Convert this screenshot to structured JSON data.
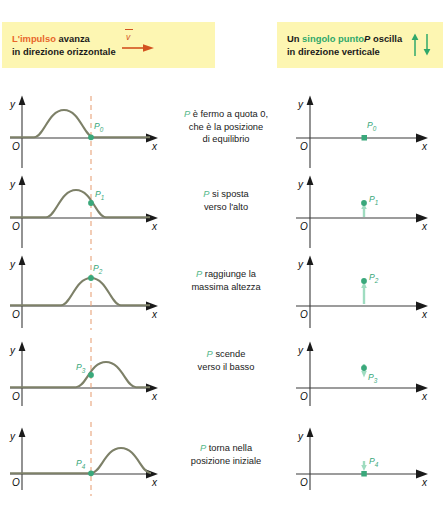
{
  "figure": {
    "title_left_parts": [
      "L'impulso",
      " avanza",
      "in direzione orizzontale"
    ],
    "title_right_parts": [
      "Un ",
      "singolo punto",
      " P",
      " oscilla",
      "in direzione verticale"
    ],
    "colors": {
      "banner_bg": "#fdf6b2",
      "pulse_curve": "#7d8068",
      "point_green": "#3aa87b",
      "dashed_line": "#e8a37a",
      "axis": "#3a3a3a",
      "orange_text": "#e8662a",
      "green_text": "#2fa86a"
    }
  },
  "banners": {
    "left": {
      "line1_highlight": "L'impulso",
      "line1_rest": " avanza",
      "line2": "in direzione orizzontale",
      "icon": "velocity-arrow-right-icon",
      "vector_symbol": "v"
    },
    "right": {
      "line1_pre": "Un ",
      "line1_highlight": "singolo punto",
      "line1_p": "P",
      "line1_rest": " oscilla",
      "line2": "in direzione verticale",
      "icon": "up-down-arrows-icon"
    }
  },
  "axes": {
    "y_label": "y",
    "x_label": "x",
    "origin_label": "O"
  },
  "rows": [
    {
      "point_label": "P",
      "point_sub": "0",
      "caption_p": "P",
      "caption_lines": [
        " è fermo a quota 0,",
        "che è la posizione",
        "di equilibrio"
      ],
      "pulse_phase": "pulse-left-of-marker",
      "point_height": 0,
      "arrow": "none"
    },
    {
      "point_label": "P",
      "point_sub": "1",
      "caption_p": "P",
      "caption_lines": [
        " si sposta",
        "verso l'alto"
      ],
      "pulse_phase": "pulse-rising-flank-at-marker",
      "point_height": 14,
      "arrow": "up"
    },
    {
      "point_label": "P",
      "point_sub": "2",
      "caption_p": "P",
      "caption_lines": [
        " raggiunge la",
        "massima altezza"
      ],
      "pulse_phase": "pulse-crest-at-marker",
      "point_height": 24,
      "arrow": "up"
    },
    {
      "point_label": "P",
      "point_sub": "3",
      "caption_p": "P",
      "caption_lines": [
        " scende",
        "verso il basso"
      ],
      "pulse_phase": "pulse-falling-flank-at-marker",
      "point_height": 12,
      "arrow": "down"
    },
    {
      "point_label": "P",
      "point_sub": "4",
      "caption_p": "P",
      "caption_lines": [
        " torna nella",
        "posizione iniziale"
      ],
      "pulse_phase": "pulse-right-of-marker",
      "point_height": 0,
      "arrow": "down"
    }
  ]
}
